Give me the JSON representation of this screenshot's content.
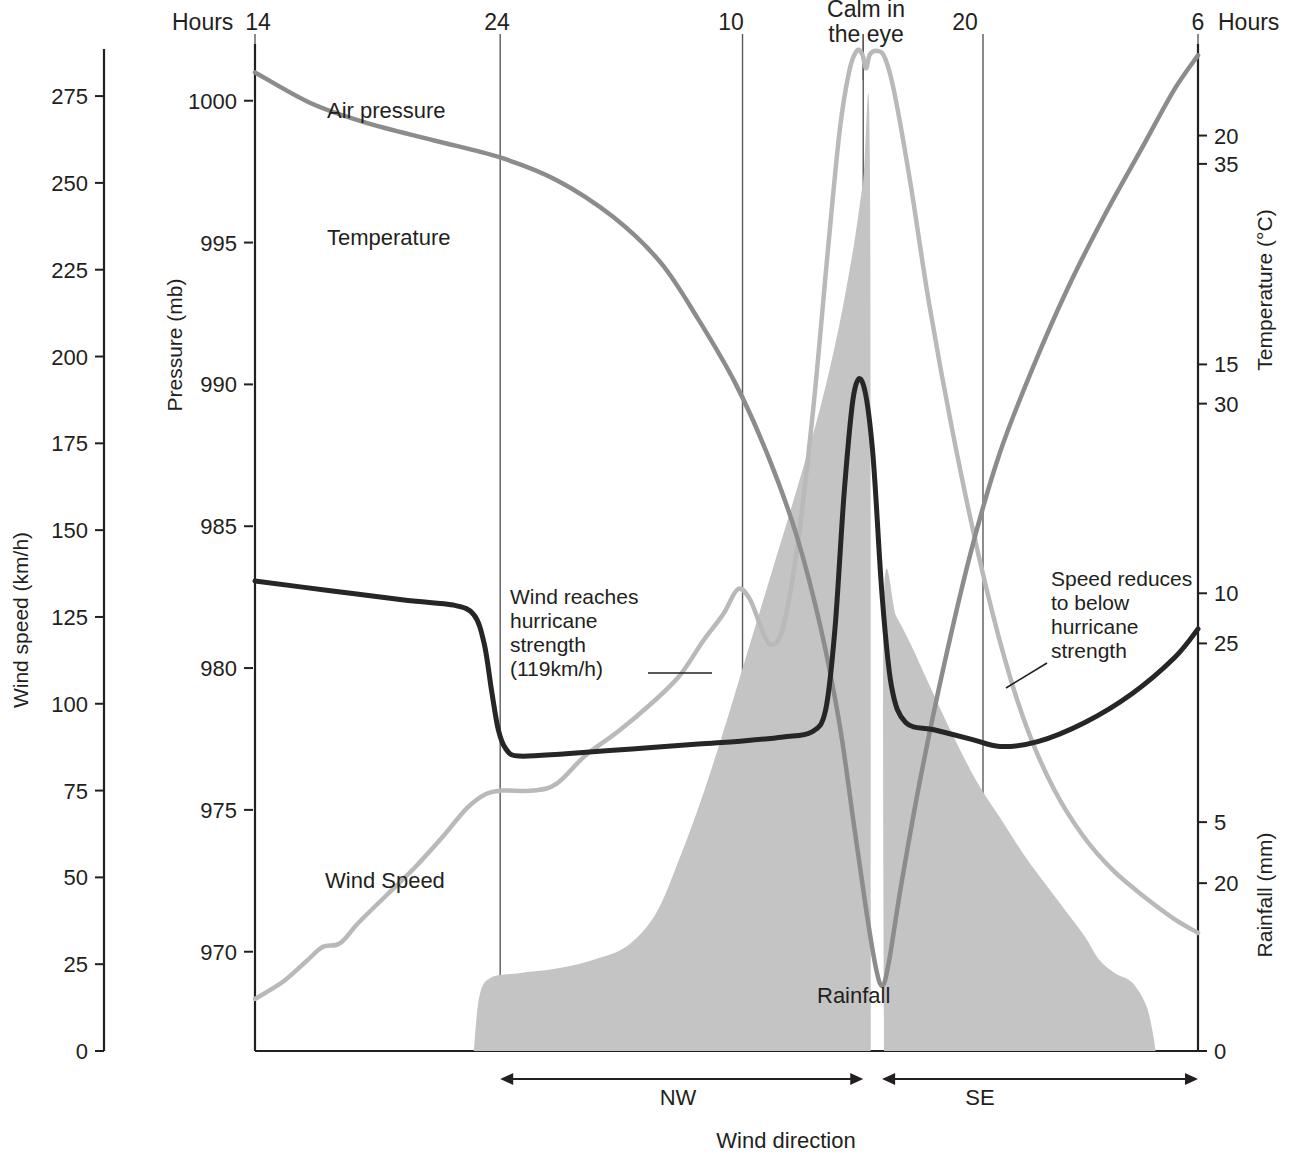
{
  "chart_data": {
    "type": "line",
    "title": "",
    "xlabel": "Wind direction",
    "x_top_label_left": "Hours",
    "x_top_label_right": "Hours",
    "x_ticks": [
      {
        "label": "14",
        "pos": 0.0
      },
      {
        "label": "24",
        "pos": 0.26
      },
      {
        "label": "10",
        "pos": 0.517
      },
      {
        "label": "20",
        "pos": 0.772
      },
      {
        "label": "6",
        "pos": 1.0
      }
    ],
    "eye_marker_label": "Calm in\nthe eye",
    "eye_marker_pos": 0.645,
    "axes": [
      {
        "name": "wind_speed",
        "title": "Wind speed (km/h)",
        "unit": "km/h",
        "side": "left-outer",
        "ticks": [
          0,
          25,
          50,
          75,
          100,
          125,
          150,
          175,
          200,
          225,
          250,
          275
        ],
        "range": [
          0,
          290
        ]
      },
      {
        "name": "pressure",
        "title": "Pressure (mb)",
        "unit": "mb",
        "side": "left-inner",
        "ticks": [
          970,
          975,
          980,
          985,
          990,
          995,
          1000
        ],
        "range": [
          966.5,
          1002
        ]
      },
      {
        "name": "temperature",
        "title": "Temperature (°C)",
        "unit": "°C",
        "side": "right-upper",
        "ticks": [
          20,
          25,
          30,
          35
        ],
        "range": [
          16.5,
          37.5
        ]
      },
      {
        "name": "rainfall",
        "title": "Rainfall (mm)",
        "unit": "mm",
        "side": "right-lower",
        "ticks": [
          0,
          5,
          10,
          15,
          20
        ],
        "range": [
          0,
          22
        ]
      }
    ],
    "series": [
      {
        "name": "Air pressure",
        "label": "Air pressure",
        "axis": "pressure",
        "color": "#8c8c8c",
        "style": "line",
        "width": 4.5,
        "points": [
          [
            0.0,
            1001.0
          ],
          [
            0.06,
            999.9
          ],
          [
            0.12,
            999.2
          ],
          [
            0.19,
            998.6
          ],
          [
            0.26,
            998.0
          ],
          [
            0.32,
            997.2
          ],
          [
            0.38,
            995.9
          ],
          [
            0.43,
            994.3
          ],
          [
            0.47,
            992.3
          ],
          [
            0.51,
            990.0
          ],
          [
            0.545,
            987.4
          ],
          [
            0.575,
            984.6
          ],
          [
            0.6,
            981.4
          ],
          [
            0.62,
            978.0
          ],
          [
            0.635,
            974.5
          ],
          [
            0.648,
            971.5
          ],
          [
            0.658,
            969.5
          ],
          [
            0.665,
            968.8
          ],
          [
            0.672,
            969.6
          ],
          [
            0.685,
            972.3
          ],
          [
            0.705,
            976.0
          ],
          [
            0.73,
            980.0
          ],
          [
            0.76,
            984.2
          ],
          [
            0.79,
            987.6
          ],
          [
            0.825,
            990.6
          ],
          [
            0.862,
            993.4
          ],
          [
            0.9,
            995.9
          ],
          [
            0.94,
            998.3
          ],
          [
            0.975,
            1000.4
          ],
          [
            1.0,
            1001.6
          ]
        ]
      },
      {
        "name": "Temperature",
        "label": "Temperature",
        "axis": "temperature",
        "color": "#262626",
        "style": "line",
        "width": 5.0,
        "points": [
          [
            0.0,
            26.3
          ],
          [
            0.08,
            26.1
          ],
          [
            0.16,
            25.9
          ],
          [
            0.21,
            25.8
          ],
          [
            0.232,
            25.6
          ],
          [
            0.243,
            25.0
          ],
          [
            0.251,
            24.0
          ],
          [
            0.258,
            23.2
          ],
          [
            0.266,
            22.8
          ],
          [
            0.28,
            22.65
          ],
          [
            0.33,
            22.7
          ],
          [
            0.4,
            22.8
          ],
          [
            0.47,
            22.9
          ],
          [
            0.52,
            22.97
          ],
          [
            0.56,
            23.05
          ],
          [
            0.59,
            23.15
          ],
          [
            0.605,
            23.6
          ],
          [
            0.615,
            25.3
          ],
          [
            0.625,
            28.2
          ],
          [
            0.635,
            30.2
          ],
          [
            0.645,
            30.4
          ],
          [
            0.655,
            29.0
          ],
          [
            0.665,
            26.0
          ],
          [
            0.675,
            24.1
          ],
          [
            0.69,
            23.35
          ],
          [
            0.72,
            23.2
          ],
          [
            0.76,
            23.0
          ],
          [
            0.79,
            22.85
          ],
          [
            0.83,
            22.95
          ],
          [
            0.88,
            23.35
          ],
          [
            0.93,
            23.95
          ],
          [
            0.975,
            24.7
          ],
          [
            1.0,
            25.3
          ]
        ]
      },
      {
        "name": "Wind Speed",
        "label": "Wind Speed",
        "axis": "wind_speed",
        "color": "#b9b9b9",
        "style": "line",
        "width": 4.5,
        "points": [
          [
            0.0,
            15
          ],
          [
            0.03,
            20
          ],
          [
            0.055,
            26
          ],
          [
            0.072,
            30
          ],
          [
            0.09,
            31
          ],
          [
            0.11,
            37
          ],
          [
            0.14,
            45
          ],
          [
            0.17,
            53
          ],
          [
            0.2,
            62
          ],
          [
            0.225,
            70
          ],
          [
            0.245,
            74
          ],
          [
            0.262,
            75
          ],
          [
            0.295,
            75
          ],
          [
            0.32,
            77
          ],
          [
            0.35,
            85
          ],
          [
            0.385,
            92
          ],
          [
            0.42,
            100
          ],
          [
            0.45,
            108
          ],
          [
            0.475,
            118
          ],
          [
            0.497,
            126
          ],
          [
            0.512,
            133
          ],
          [
            0.525,
            130
          ],
          [
            0.538,
            121
          ],
          [
            0.548,
            117
          ],
          [
            0.56,
            122
          ],
          [
            0.575,
            145
          ],
          [
            0.592,
            185
          ],
          [
            0.608,
            232
          ],
          [
            0.62,
            265
          ],
          [
            0.63,
            282
          ],
          [
            0.638,
            288
          ],
          [
            0.644,
            287
          ],
          [
            0.648,
            283
          ],
          [
            0.652,
            287
          ],
          [
            0.66,
            288
          ],
          [
            0.668,
            286
          ],
          [
            0.678,
            276
          ],
          [
            0.695,
            250
          ],
          [
            0.715,
            215
          ],
          [
            0.74,
            178
          ],
          [
            0.768,
            142
          ],
          [
            0.795,
            113
          ],
          [
            0.82,
            92
          ],
          [
            0.848,
            75
          ],
          [
            0.878,
            62
          ],
          [
            0.91,
            52
          ],
          [
            0.945,
            44
          ],
          [
            0.975,
            38
          ],
          [
            1.0,
            34
          ]
        ]
      },
      {
        "name": "Rainfall",
        "label": "Rainfall",
        "axis": "rainfall",
        "color": "#c4c4c4",
        "style": "area",
        "segments": [
          {
            "points": [
              [
                0.232,
                0.0
              ],
              [
                0.238,
                1.2
              ],
              [
                0.25,
                1.6
              ],
              [
                0.28,
                1.7
              ],
              [
                0.32,
                1.8
              ],
              [
                0.36,
                2.0
              ],
              [
                0.395,
                2.3
              ],
              [
                0.425,
                3.0
              ],
              [
                0.45,
                4.2
              ],
              [
                0.475,
                5.6
              ],
              [
                0.5,
                7.2
              ],
              [
                0.525,
                8.9
              ],
              [
                0.55,
                10.6
              ],
              [
                0.575,
                12.3
              ],
              [
                0.6,
                14.1
              ],
              [
                0.62,
                15.9
              ],
              [
                0.635,
                17.6
              ],
              [
                0.645,
                19.0
              ],
              [
                0.652,
                19.6
              ],
              [
                0.653,
                0.0
              ]
            ]
          },
          {
            "points": [
              [
                0.667,
                0.0
              ],
              [
                0.667,
                9.9
              ],
              [
                0.68,
                9.5
              ],
              [
                0.695,
                8.9
              ],
              [
                0.715,
                8.0
              ],
              [
                0.74,
                6.9
              ],
              [
                0.765,
                5.9
              ],
              [
                0.79,
                5.1
              ],
              [
                0.815,
                4.3
              ],
              [
                0.84,
                3.6
              ],
              [
                0.862,
                3.0
              ],
              [
                0.88,
                2.5
              ],
              [
                0.895,
                2.0
              ],
              [
                0.912,
                1.7
              ],
              [
                0.93,
                1.5
              ],
              [
                0.945,
                1.0
              ],
              [
                0.952,
                0.4
              ],
              [
                0.955,
                0.0
              ]
            ]
          }
        ]
      }
    ],
    "annotations": [
      {
        "name": "hurricane-strength-annotation",
        "text": "Wind reaches\nhurricane\nstrength\n(119km/h)",
        "align": "left"
      },
      {
        "name": "speed-reduces-annotation",
        "text": "Speed reduces\nto below\nhurricane\nstrength",
        "align": "left"
      }
    ],
    "wind_direction": {
      "caption": "Wind direction",
      "segments": [
        {
          "label": "NW",
          "start": 0.26,
          "end": 0.645
        },
        {
          "label": "SE",
          "start": 0.665,
          "end": 1.0
        }
      ]
    },
    "grid": {
      "vertical": true,
      "horizontal": false
    },
    "legend_position": "inline-labels"
  },
  "labels": {
    "hours_left": "Hours",
    "hours_right": "Hours",
    "calm_in_eye_line1": "Calm in",
    "calm_in_eye_line2": "the eye",
    "wind_speed_axis": "Wind speed (km/h)",
    "pressure_axis": "Pressure (mb)",
    "temperature_axis": "Temperature (°C)",
    "rainfall_axis": "Rainfall (mm)",
    "air_pressure_series": "Air pressure",
    "temperature_series": "Temperature",
    "wind_speed_series": "Wind Speed",
    "rainfall_series": "Rainfall",
    "wind_direction": "Wind direction",
    "nw": "NW",
    "se": "SE",
    "annot1_l1": "Wind reaches",
    "annot1_l2": "hurricane",
    "annot1_l3": "strength",
    "annot1_l4": "(119km/h)",
    "annot2_l1": "Speed reduces",
    "annot2_l2": "to below",
    "annot2_l3": "hurricane",
    "annot2_l4": "strength",
    "x_tick_1": "14",
    "x_tick_2": "24",
    "x_tick_3": "10",
    "x_tick_4": "20",
    "x_tick_5": "6"
  },
  "colors": {
    "air_pressure": "#8c8c8c",
    "temperature": "#262626",
    "wind_speed": "#b9b9b9",
    "rainfall": "#c4c4c4",
    "axis": "#231f20",
    "grid": "#5a5a5a",
    "background": "#ffffff"
  }
}
